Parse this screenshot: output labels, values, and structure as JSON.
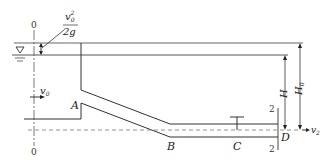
{
  "diagram": {
    "type": "hydraulics-pipe-flow",
    "labels": {
      "section_0_top": "0",
      "section_0_bottom": "0",
      "velocity_head_num": "v",
      "velocity_head_num_sub": "0",
      "velocity_head_num_sup": "2",
      "velocity_head_den": "2g",
      "v0": "v",
      "v0_sub": "0",
      "point_A": "A",
      "point_B": "B",
      "point_C": "C",
      "point_D": "D",
      "section_2_top": "2",
      "section_2_bottom": "2",
      "H": "H",
      "H0": "H",
      "H0_sub": "0",
      "v2": "v",
      "v2_sub": "2",
      "water_surface_symbol": "∇"
    },
    "colors": {
      "line": "#333333",
      "dashed": "#666666"
    }
  }
}
